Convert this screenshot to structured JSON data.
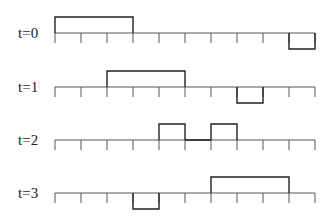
{
  "diagram": {
    "title": "",
    "axis": {
      "x_start": 55,
      "tick_spacing": 26,
      "tick_count": 11,
      "tick_length": 10,
      "pulse_height": 16,
      "colors": {
        "axis": "#555555",
        "pulse": "#222222",
        "label": "#222222"
      }
    },
    "rows": [
      {
        "label": "t=0",
        "baseline_y": 33,
        "first_tick_full": true,
        "pulses": [
          {
            "from_tick": 0,
            "to_tick": 3,
            "direction": "up"
          },
          {
            "from_tick": 9,
            "to_tick": 10,
            "direction": "down"
          }
        ],
        "thick_segments": []
      },
      {
        "label": "t=1",
        "baseline_y": 87,
        "first_tick_full": false,
        "pulses": [
          {
            "from_tick": 2,
            "to_tick": 5,
            "direction": "up"
          },
          {
            "from_tick": 7,
            "to_tick": 8,
            "direction": "down"
          }
        ],
        "thick_segments": []
      },
      {
        "label": "t=2",
        "baseline_y": 140,
        "first_tick_full": false,
        "pulses": [
          {
            "from_tick": 4,
            "to_tick": 5,
            "direction": "up"
          },
          {
            "from_tick": 6,
            "to_tick": 7,
            "direction": "up"
          }
        ],
        "thick_segments": [
          {
            "from_tick": 5,
            "to_tick": 6
          }
        ]
      },
      {
        "label": "t=3",
        "baseline_y": 193,
        "first_tick_full": false,
        "pulses": [
          {
            "from_tick": 3,
            "to_tick": 4,
            "direction": "down"
          },
          {
            "from_tick": 6,
            "to_tick": 9,
            "direction": "up"
          }
        ],
        "thick_segments": []
      }
    ]
  }
}
